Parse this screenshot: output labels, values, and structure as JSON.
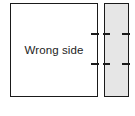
{
  "diagram": {
    "title": "Wrong side",
    "background_color": "#ffffff",
    "line_color": "#1a1a1a",
    "main_panel": {
      "label": "Wrong side",
      "fill_color": "#ffffff",
      "x": 10,
      "y": 3,
      "width": 88,
      "height": 94
    },
    "side_strip": {
      "label": "",
      "fill_color": "#e6e6e6",
      "x": 104,
      "y": 3,
      "width": 25,
      "height": 94
    },
    "ticks": [
      {
        "name": "upper-tick",
        "y": 33
      },
      {
        "name": "lower-tick",
        "y": 63
      }
    ]
  }
}
